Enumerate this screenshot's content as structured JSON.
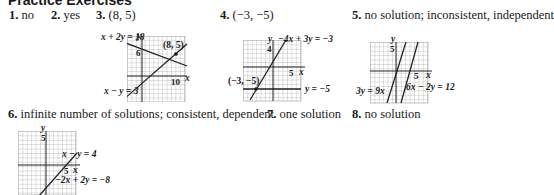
{
  "title": "Practice Exercises",
  "answers": [
    {
      "number": "1.",
      "text": "no"
    },
    {
      "number": "2.",
      "text": "yes"
    },
    {
      "number": "3.",
      "text": "(8, 5)"
    },
    {
      "number": "4.",
      "text": "(−3, −5)"
    },
    {
      "number": "5.",
      "text": "no solution; inconsistent, independent"
    },
    {
      "number": "6.",
      "text": "infinite number of solutions; consistent, dependent"
    },
    {
      "number": "7.",
      "text": "one solution"
    },
    {
      "number": "8.",
      "text": "no solution"
    }
  ],
  "graphs": {
    "g3": {
      "eq1": "x + 2y = 18",
      "eq2": "x − y = 3",
      "point": "(8, 5)",
      "ytick": "6",
      "xtick": "10",
      "xaxis": "x",
      "yaxis": "y"
    },
    "g4": {
      "eq1": "−4x + 3y = −3",
      "eq2": "y = −5",
      "point": "(−3, −5)",
      "ytick": "4",
      "xtick": "5",
      "xaxis": "x",
      "yaxis": "y"
    },
    "g5": {
      "eq1": "3y = 9x",
      "eq2": "6x − 2y = 12",
      "ytick": "5",
      "xtick": "5",
      "xaxis": "x",
      "yaxis": "y"
    },
    "g6": {
      "eq1": "x − y = 4",
      "eq2": "−2x + 2y = −8",
      "ytick": "5",
      "xtick": "5",
      "xaxis": "x",
      "yaxis": "y"
    }
  }
}
